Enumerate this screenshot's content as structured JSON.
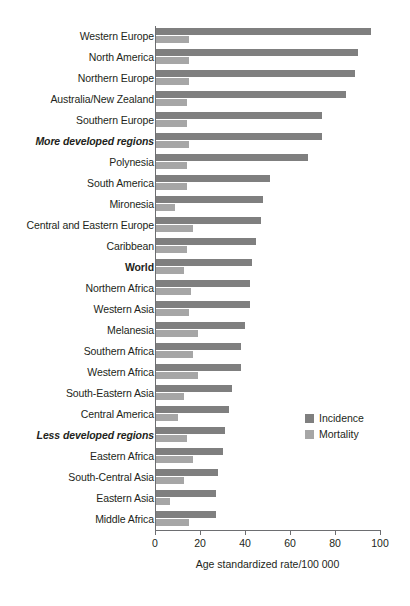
{
  "chart_data": {
    "type": "bar",
    "orientation": "horizontal",
    "title": "",
    "xlabel": "Age standardized rate/100 000",
    "ylabel": "",
    "xlim": [
      0,
      100
    ],
    "xticks": [
      0,
      20,
      40,
      60,
      80,
      100
    ],
    "grid": false,
    "legend_position": "middle-right",
    "colors": {
      "incidence": "#7f7f7f",
      "mortality": "#a6a6a6"
    },
    "categories": [
      "Western Europe",
      "North America",
      "Northern Europe",
      "Australia/New Zealand",
      "Southern Europe",
      "More developed regions",
      "Polynesia",
      "South America",
      "Mironesia",
      "Central and Eastern Europe",
      "Caribbean",
      "World",
      "Northern Africa",
      "Western Asia",
      "Melanesia",
      "Southern Africa",
      "Western Africa",
      "South-Eastern Asia",
      "Central America",
      "Less developed regions",
      "Eastern Africa",
      "South-Central Asia",
      "Eastern Asia",
      "Middle Africa"
    ],
    "category_styles": [
      "normal",
      "normal",
      "normal",
      "normal",
      "normal",
      "italic",
      "normal",
      "normal",
      "normal",
      "normal",
      "normal",
      "bold",
      "normal",
      "normal",
      "normal",
      "normal",
      "normal",
      "normal",
      "normal",
      "italic",
      "normal",
      "normal",
      "normal",
      "normal"
    ],
    "series": [
      {
        "name": "Incidence",
        "values": [
          96,
          90,
          89,
          85,
          74,
          74,
          68,
          51,
          48,
          47,
          45,
          43,
          42,
          42,
          40,
          38,
          38,
          34,
          33,
          31,
          30,
          28,
          27,
          27
        ]
      },
      {
        "name": "Mortality",
        "values": [
          15,
          15,
          15,
          14,
          14,
          15,
          14,
          14,
          9,
          17,
          14,
          13,
          16,
          15,
          19,
          17,
          19,
          13,
          10,
          14,
          17,
          13,
          6.5,
          15
        ]
      }
    ]
  },
  "legend": {
    "items": [
      {
        "label": "Incidence",
        "swatch": "incidence-swatch"
      },
      {
        "label": "Mortality",
        "swatch": "mortality-swatch"
      }
    ]
  },
  "axis": {
    "title": "Age standardized rate/100 000",
    "tick_labels": [
      "0",
      "20",
      "40",
      "60",
      "80",
      "100"
    ]
  }
}
